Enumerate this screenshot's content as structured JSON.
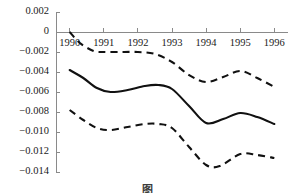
{
  "chart_data": {
    "type": "line",
    "title": "",
    "xlabel": "",
    "ylabel": "",
    "xlim": [
      1989.6,
      1996.4
    ],
    "ylim": [
      -0.014,
      0.002
    ],
    "grid": false,
    "legend": "none",
    "y_ticks": [
      0.002,
      0,
      -0.002,
      -0.004,
      -0.006,
      -0.008,
      -0.01,
      -0.012,
      -0.014
    ],
    "y_tick_labels": [
      "0.002",
      "0",
      "−0.002",
      "−0.004",
      "−0.006",
      "−0.008",
      "−0.010",
      "−0.012",
      "−0.014"
    ],
    "x_ticks": [
      1990,
      1991,
      1992,
      1993,
      1994,
      1995,
      1996
    ],
    "x_tick_labels": [
      "1990",
      "1991",
      "1992",
      "1993",
      "1994",
      "1995",
      "1996"
    ],
    "zero_line": 0,
    "series": [
      {
        "name": "upper-confidence-bound",
        "style": "dashed",
        "x": [
          1990.0,
          1990.3,
          1990.7,
          1991.0,
          1991.5,
          1992.0,
          1992.5,
          1993.0,
          1993.5,
          1994.0,
          1994.5,
          1995.0,
          1995.5,
          1996.0
        ],
        "values": [
          0.0,
          -0.0011,
          -0.0019,
          -0.002,
          -0.002,
          -0.002,
          -0.0022,
          -0.003,
          -0.0043,
          -0.005,
          -0.0045,
          -0.0039,
          -0.0046,
          -0.0055
        ]
      },
      {
        "name": "central-estimate",
        "style": "solid",
        "x": [
          1990.0,
          1990.4,
          1990.8,
          1991.2,
          1991.7,
          1992.2,
          1992.6,
          1993.0,
          1993.5,
          1994.0,
          1994.5,
          1995.0,
          1995.5,
          1996.0
        ],
        "values": [
          -0.0038,
          -0.0046,
          -0.0056,
          -0.006,
          -0.0058,
          -0.0054,
          -0.0053,
          -0.0057,
          -0.0074,
          -0.0091,
          -0.0087,
          -0.0081,
          -0.0085,
          -0.0092
        ]
      },
      {
        "name": "lower-confidence-bound",
        "style": "dashed",
        "x": [
          1990.0,
          1990.4,
          1990.8,
          1991.2,
          1991.7,
          1992.2,
          1992.6,
          1993.0,
          1993.5,
          1994.0,
          1994.4,
          1995.0,
          1995.5,
          1996.0
        ],
        "values": [
          -0.0078,
          -0.0088,
          -0.0096,
          -0.0098,
          -0.0095,
          -0.0092,
          -0.0092,
          -0.0096,
          -0.0115,
          -0.0133,
          -0.0134,
          -0.0122,
          -0.0123,
          -0.0126
        ]
      }
    ]
  },
  "caption": {
    "text": "图"
  }
}
